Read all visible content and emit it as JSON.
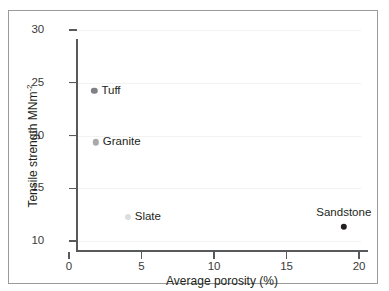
{
  "chart_data": {
    "type": "scatter",
    "title": "",
    "xlabel": "Average porosity (%)",
    "ylabel": "Tensile strength MNm",
    "ylabel_superscript": "-2",
    "xlim": [
      0,
      20
    ],
    "ylim": [
      10,
      30
    ],
    "xticks": [
      0,
      5,
      10,
      15,
      20
    ],
    "yticks": [
      10,
      15,
      20,
      25,
      30
    ],
    "xtick_labels": [
      "0",
      "5",
      "10",
      "15",
      "20"
    ],
    "ytick_labels": [
      "10",
      "15",
      "20",
      "25",
      "30"
    ],
    "grid": "horizontal",
    "legend": "none",
    "points": [
      {
        "name": "Tuff",
        "x": 1.2,
        "y": 25.2,
        "color": "#808184",
        "radius": 3.2,
        "label_position": "right"
      },
      {
        "name": "Granite",
        "x": 1.3,
        "y": 20.3,
        "color": "#a7a9ac",
        "radius": 3.2,
        "label_position": "right"
      },
      {
        "name": "Slate",
        "x": 3.5,
        "y": 13.2,
        "color": "#dcdddf",
        "radius": 3.0,
        "label_position": "right"
      },
      {
        "name": "Sandstone",
        "x": 18.4,
        "y": 12.3,
        "color": "#231f20",
        "radius": 3.2,
        "label_position": "above"
      }
    ]
  },
  "colors": {
    "axis": "#58595b",
    "gridline": "#f2f2f2",
    "frame": "#9b9b9b",
    "text": "#231f20",
    "background": "#ffffff"
  }
}
